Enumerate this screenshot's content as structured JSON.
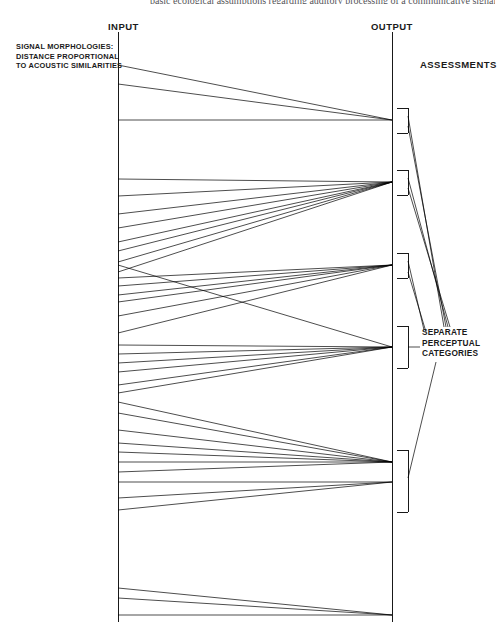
{
  "page": {
    "top_running_text": "basic ecological assumptions regarding auditory processing of a communicative signal"
  },
  "labels": {
    "input": "INPUT",
    "output": "OUTPUT",
    "assessments": "ASSESSMENTS",
    "signal_morphologies": "SIGNAL MORPHOLOGIES: DISTANCE PROPORTIONAL TO ACOUSTIC SIMILARITIES",
    "separate_categories": "SEPARATE PERCEPTUAL CATEGORIES"
  },
  "diagram": {
    "type": "fan-mapping-diagram",
    "input_axis": {
      "x": 118,
      "y_top": 32,
      "y_bottom": 622
    },
    "output_axis": {
      "x": 392,
      "y_top": 32,
      "y_bottom": 622
    },
    "stroke_color": "#000000",
    "stroke_width": 0.7,
    "output_nodes": [
      {
        "id": "node-1",
        "y": 120
      },
      {
        "id": "node-2",
        "y": 182
      },
      {
        "id": "node-3",
        "y": 265
      },
      {
        "id": "node-4",
        "y": 347
      },
      {
        "id": "node-5",
        "y": 462
      },
      {
        "id": "node-6",
        "y": 482
      },
      {
        "id": "node-7",
        "y": 615
      }
    ],
    "connections": [
      {
        "from_y": 65,
        "to_y": 120
      },
      {
        "from_y": 84,
        "to_y": 120
      },
      {
        "from_y": 120,
        "to_y": 120
      },
      {
        "from_y": 179,
        "to_y": 182
      },
      {
        "from_y": 196,
        "to_y": 182
      },
      {
        "from_y": 214,
        "to_y": 182
      },
      {
        "from_y": 228,
        "to_y": 182
      },
      {
        "from_y": 242,
        "to_y": 182
      },
      {
        "from_y": 251,
        "to_y": 182
      },
      {
        "from_y": 262,
        "to_y": 182
      },
      {
        "from_y": 272,
        "to_y": 182
      },
      {
        "from_y": 278,
        "to_y": 265
      },
      {
        "from_y": 286,
        "to_y": 265
      },
      {
        "from_y": 295,
        "to_y": 265
      },
      {
        "from_y": 302,
        "to_y": 265
      },
      {
        "from_y": 316,
        "to_y": 265
      },
      {
        "from_y": 333,
        "to_y": 265
      },
      {
        "from_y": 265,
        "to_y": 347
      },
      {
        "from_y": 345,
        "to_y": 347
      },
      {
        "from_y": 354,
        "to_y": 347
      },
      {
        "from_y": 363,
        "to_y": 347
      },
      {
        "from_y": 372,
        "to_y": 347
      },
      {
        "from_y": 385,
        "to_y": 347
      },
      {
        "from_y": 393,
        "to_y": 347
      },
      {
        "from_y": 402,
        "to_y": 462
      },
      {
        "from_y": 413,
        "to_y": 462
      },
      {
        "from_y": 430,
        "to_y": 462
      },
      {
        "from_y": 443,
        "to_y": 462
      },
      {
        "from_y": 452,
        "to_y": 462
      },
      {
        "from_y": 462,
        "to_y": 462
      },
      {
        "from_y": 472,
        "to_y": 462
      },
      {
        "from_y": 482,
        "to_y": 482
      },
      {
        "from_y": 498,
        "to_y": 482
      },
      {
        "from_y": 510,
        "to_y": 482
      },
      {
        "from_y": 588,
        "to_y": 615
      },
      {
        "from_y": 598,
        "to_y": 615
      },
      {
        "from_y": 615,
        "to_y": 615
      }
    ],
    "brackets": [
      {
        "id": "bracket-1",
        "y_top": 108,
        "y_bottom": 133,
        "x": 397,
        "width": 11
      },
      {
        "id": "bracket-2",
        "y_top": 170,
        "y_bottom": 195,
        "x": 397,
        "width": 11
      },
      {
        "id": "bracket-3",
        "y_top": 253,
        "y_bottom": 278,
        "x": 397,
        "width": 11
      },
      {
        "id": "bracket-4",
        "y_top": 326,
        "y_bottom": 368,
        "x": 397,
        "width": 11
      },
      {
        "id": "bracket-5",
        "y_top": 450,
        "y_bottom": 512,
        "x": 397,
        "width": 11
      }
    ],
    "leader_lines": [
      {
        "from": [
          408,
          116
        ],
        "to": [
          444,
          327
        ]
      },
      {
        "from": [
          408,
          126
        ],
        "to": [
          446,
          327
        ]
      },
      {
        "from": [
          408,
          178
        ],
        "to": [
          448,
          327
        ]
      },
      {
        "from": [
          408,
          188
        ],
        "to": [
          450,
          327
        ]
      },
      {
        "from": [
          408,
          261
        ],
        "to": [
          424,
          330
        ]
      },
      {
        "from": [
          408,
          272
        ],
        "to": [
          426,
          332
        ]
      },
      {
        "from": [
          408,
          347
        ],
        "to": [
          420,
          347
        ]
      },
      {
        "from": [
          408,
          478
        ],
        "to": [
          436,
          362
        ]
      }
    ]
  }
}
